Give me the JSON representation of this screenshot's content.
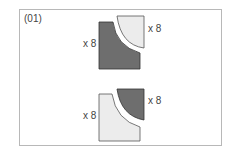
{
  "diagram": {
    "id_label": "(01)",
    "colors": {
      "dark": "#6e6e6e",
      "light": "#ececec",
      "stroke": "#333333",
      "frame": "#b8b8b8"
    },
    "groups": [
      {
        "name": "top",
        "large_piece": {
          "fill": "dark",
          "count_label": "x 8"
        },
        "quarter_piece": {
          "fill": "light",
          "count_label": "x 8"
        }
      },
      {
        "name": "bottom",
        "large_piece": {
          "fill": "light",
          "count_label": "x 8"
        },
        "quarter_piece": {
          "fill": "dark",
          "count_label": "x 8"
        }
      }
    ]
  }
}
